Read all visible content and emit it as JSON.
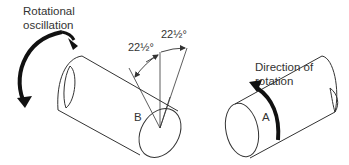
{
  "labels": {
    "rotational_oscillation_line1": "Rotational",
    "rotational_oscillation_line2": "oscillation",
    "angle_left": "22½°",
    "angle_right": "22½°",
    "direction_line1": "Direction of",
    "direction_line2": "rotation",
    "shaft_b": "B",
    "shaft_a": "A"
  },
  "colors": {
    "line": "#333333",
    "arrow": "#111111",
    "background": "#ffffff"
  }
}
